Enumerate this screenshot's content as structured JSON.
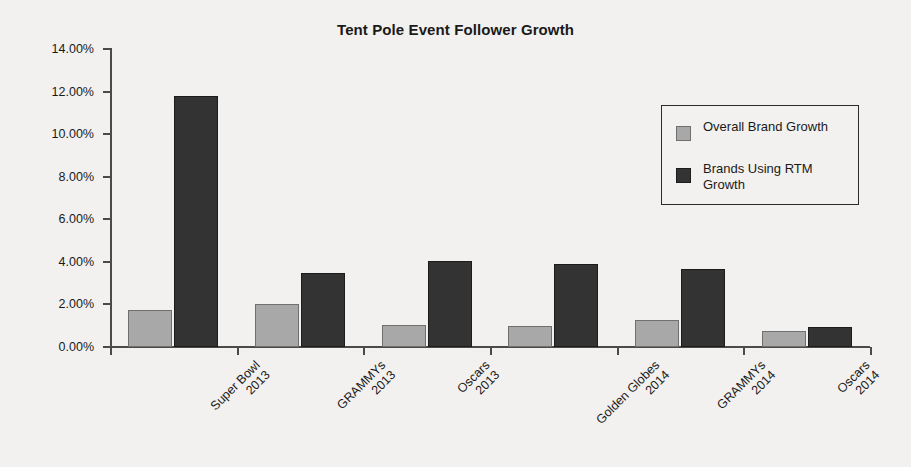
{
  "chart_data": {
    "type": "bar",
    "title": "Tent Pole Event Follower Growth",
    "xlabel": "",
    "ylabel": "",
    "ylim": [
      0,
      14
    ],
    "ytick_labels": [
      "0.00%",
      "2.00%",
      "4.00%",
      "6.00%",
      "8.00%",
      "10.00%",
      "12.00%",
      "14.00%"
    ],
    "ytick_values": [
      0,
      2,
      4,
      6,
      8,
      10,
      12,
      14
    ],
    "grid": false,
    "legend_position": "upper right",
    "categories": [
      {
        "line1": "Super Bowl",
        "line2": "2013"
      },
      {
        "line1": "GRAMMYs",
        "line2": "2013"
      },
      {
        "line1": "Oscars",
        "line2": "2013"
      },
      {
        "line1": "Golden Globes",
        "line2": "2014"
      },
      {
        "line1": "GRAMMYs",
        "line2": "2014"
      },
      {
        "line1": "Oscars",
        "line2": "2014"
      }
    ],
    "series": [
      {
        "name": "Overall Brand Growth",
        "color": "#a8a8a8",
        "values": [
          1.75,
          2.0,
          1.05,
          1.0,
          1.25,
          0.75
        ]
      },
      {
        "name": "Brands Using RTM Growth",
        "color": "#333333",
        "values": [
          11.8,
          3.5,
          4.05,
          3.9,
          3.65,
          0.95
        ]
      }
    ]
  },
  "legend": {
    "entries": [
      {
        "label": "Overall Brand Growth"
      },
      {
        "label": "Brands Using RTM Growth"
      }
    ]
  }
}
